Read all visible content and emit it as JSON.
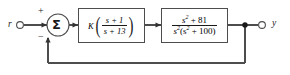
{
  "diagram": {
    "type": "control-system-block-diagram",
    "line_color": "#4d4d4d",
    "text_color": "#1a1a1a",
    "background": "#ffffff",
    "input": {
      "label": "r",
      "terminal": "open-circle"
    },
    "output": {
      "label": "y",
      "terminal": "open-circle",
      "takeoff_node": "filled-dot"
    },
    "summer": {
      "glyph": "Σ",
      "plus_sign": "+",
      "minus_sign": "−",
      "plus_input": "reference",
      "minus_input": "feedback"
    },
    "blocks": [
      {
        "name": "controller",
        "gain": "K",
        "numerator": "s + 1",
        "denominator": "s + 13",
        "parens": true
      },
      {
        "name": "plant",
        "numerator_base": "s",
        "numerator_exp": "2",
        "numerator_rest": " + 81",
        "denominator_base": "s",
        "denominator_exp": "2",
        "denominator_rest_open": "(s",
        "denominator_rest_exp": "2",
        "denominator_rest_close": " + 100)",
        "parens": false
      }
    ],
    "feedback": {
      "path": "unity",
      "label": ""
    }
  }
}
